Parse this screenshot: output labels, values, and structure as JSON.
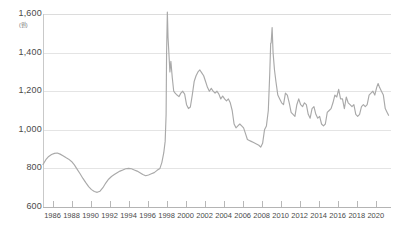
{
  "header": {
    "cropped_text": "————  ————"
  },
  "colors": {
    "line": "#a9a9a9",
    "grid": "#e4e4e4",
    "axis": "#b4b4b4",
    "text": "#4a4a4a",
    "background": "#ffffff"
  },
  "chart_data": {
    "type": "line",
    "title": "",
    "xlabel": "",
    "ylabel": "",
    "unit_label": "(원)",
    "ylim": [
      600,
      1600
    ],
    "xlim": [
      1985.0,
      2021.5
    ],
    "grid": true,
    "legend": "none",
    "yticks": [
      "600",
      "800",
      "1,000",
      "1,200",
      "1,400",
      "1,600"
    ],
    "ytick_values": [
      600,
      800,
      1000,
      1200,
      1400,
      1600
    ],
    "xticks": [
      "1986",
      "1988",
      "1990",
      "1992",
      "1994",
      "1996",
      "1998",
      "2000",
      "2002",
      "2004",
      "2006",
      "2008",
      "2010",
      "2012",
      "2014",
      "2016",
      "2018",
      "2020"
    ],
    "xtick_values": [
      1986,
      1988,
      1990,
      1992,
      1994,
      1996,
      1998,
      2000,
      2002,
      2004,
      2006,
      2008,
      2010,
      2012,
      2014,
      2016,
      2018,
      2020
    ],
    "series": [
      {
        "name": "exchange-rate",
        "color": "#a9a9a9",
        "x": [
          1985.0,
          1985.3,
          1985.6,
          1985.9,
          1986.2,
          1986.5,
          1986.8,
          1987.1,
          1987.4,
          1987.7,
          1988.0,
          1988.3,
          1988.6,
          1988.9,
          1989.2,
          1989.5,
          1989.8,
          1990.1,
          1990.4,
          1990.7,
          1991.0,
          1991.3,
          1991.6,
          1991.9,
          1992.2,
          1992.5,
          1992.8,
          1993.1,
          1993.4,
          1993.7,
          1994.0,
          1994.3,
          1994.6,
          1994.9,
          1995.2,
          1995.5,
          1995.8,
          1996.1,
          1996.4,
          1996.7,
          1997.0,
          1997.3,
          1997.5,
          1997.7,
          1997.85,
          1997.95,
          1998.0,
          1998.08,
          1998.15,
          1998.25,
          1998.35,
          1998.45,
          1998.6,
          1998.75,
          1998.9,
          1999.1,
          1999.3,
          1999.5,
          1999.7,
          1999.9,
          2000.1,
          2000.3,
          2000.5,
          2000.7,
          2000.9,
          2001.1,
          2001.3,
          2001.5,
          2001.7,
          2001.9,
          2002.1,
          2002.3,
          2002.5,
          2002.7,
          2002.9,
          2003.1,
          2003.3,
          2003.5,
          2003.7,
          2003.9,
          2004.1,
          2004.3,
          2004.5,
          2004.7,
          2004.9,
          2005.1,
          2005.3,
          2005.5,
          2005.7,
          2005.9,
          2006.1,
          2006.3,
          2006.5,
          2006.7,
          2006.9,
          2007.1,
          2007.3,
          2007.5,
          2007.7,
          2007.9,
          2008.1,
          2008.3,
          2008.5,
          2008.7,
          2008.85,
          2008.95,
          2009.0,
          2009.1,
          2009.2,
          2009.35,
          2009.5,
          2009.7,
          2009.9,
          2010.1,
          2010.3,
          2010.5,
          2010.7,
          2010.9,
          2011.1,
          2011.3,
          2011.5,
          2011.7,
          2011.9,
          2012.1,
          2012.3,
          2012.5,
          2012.7,
          2012.9,
          2013.1,
          2013.3,
          2013.5,
          2013.7,
          2013.9,
          2014.1,
          2014.3,
          2014.5,
          2014.7,
          2014.9,
          2015.1,
          2015.3,
          2015.5,
          2015.7,
          2015.9,
          2016.1,
          2016.3,
          2016.5,
          2016.7,
          2016.9,
          2017.1,
          2017.3,
          2017.5,
          2017.7,
          2017.9,
          2018.1,
          2018.3,
          2018.5,
          2018.7,
          2018.9,
          2019.1,
          2019.3,
          2019.5,
          2019.7,
          2019.9,
          2020.1,
          2020.25,
          2020.4,
          2020.6,
          2020.8,
          2021.0,
          2021.2,
          2021.35
        ],
        "y": [
          820,
          845,
          862,
          872,
          878,
          880,
          874,
          866,
          856,
          848,
          836,
          818,
          795,
          772,
          748,
          726,
          706,
          690,
          680,
          676,
          682,
          700,
          724,
          744,
          758,
          768,
          778,
          786,
          792,
          798,
          800,
          798,
          792,
          786,
          778,
          768,
          762,
          766,
          772,
          778,
          790,
          800,
          830,
          880,
          940,
          1080,
          1400,
          1610,
          1480,
          1390,
          1300,
          1355,
          1270,
          1200,
          1190,
          1180,
          1172,
          1190,
          1200,
          1185,
          1130,
          1110,
          1118,
          1180,
          1250,
          1280,
          1300,
          1310,
          1295,
          1280,
          1250,
          1220,
          1200,
          1215,
          1200,
          1190,
          1200,
          1185,
          1160,
          1175,
          1160,
          1150,
          1160,
          1140,
          1100,
          1030,
          1010,
          1020,
          1030,
          1020,
          1010,
          980,
          950,
          945,
          940,
          935,
          930,
          925,
          920,
          910,
          930,
          1000,
          1020,
          1100,
          1290,
          1450,
          1450,
          1530,
          1400,
          1310,
          1250,
          1180,
          1160,
          1140,
          1130,
          1190,
          1180,
          1140,
          1090,
          1080,
          1070,
          1130,
          1160,
          1130,
          1120,
          1140,
          1130,
          1080,
          1060,
          1110,
          1120,
          1080,
          1060,
          1070,
          1030,
          1020,
          1030,
          1090,
          1100,
          1110,
          1140,
          1180,
          1170,
          1210,
          1160,
          1160,
          1110,
          1170,
          1140,
          1130,
          1120,
          1130,
          1080,
          1070,
          1080,
          1120,
          1130,
          1120,
          1130,
          1180,
          1190,
          1200,
          1180,
          1220,
          1240,
          1220,
          1200,
          1180,
          1110,
          1090,
          1075
        ]
      }
    ]
  }
}
